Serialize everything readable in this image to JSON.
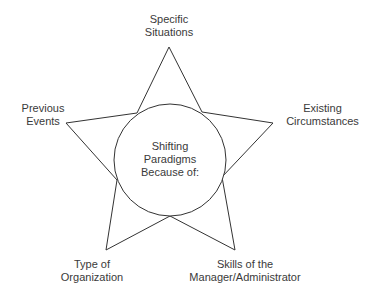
{
  "diagram": {
    "center": {
      "lines": [
        "Shifting",
        "Paradigms",
        "Because of:"
      ]
    },
    "points": [
      {
        "id": "top",
        "lines": [
          "Specific",
          "Situations"
        ]
      },
      {
        "id": "left",
        "lines": [
          "Previous",
          "Events"
        ]
      },
      {
        "id": "right",
        "lines": [
          "Existing",
          "Circumstances"
        ]
      },
      {
        "id": "bottom-left",
        "lines": [
          "Type of",
          "Organization"
        ]
      },
      {
        "id": "bottom-right",
        "lines": [
          "Skills of the",
          "Manager/Administrator"
        ]
      }
    ],
    "colors": {
      "stroke": "#333333",
      "text": "#3a3a3a",
      "background": "#ffffff"
    }
  }
}
